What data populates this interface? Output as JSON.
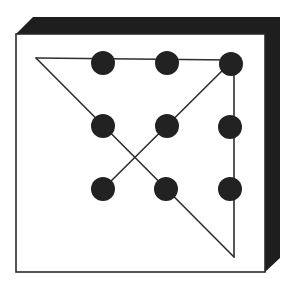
{
  "figure": {
    "width": 294,
    "height": 285,
    "colors": {
      "background": "#ffffff",
      "box_face": "#ffffff",
      "box_shadow": "#1e1e1e",
      "box_outline": "#2a2a2a",
      "dot": "#222222",
      "line": "#2e2e2e"
    },
    "box": {
      "front_face": {
        "x": 16,
        "y": 34,
        "width": 249,
        "height": 238
      },
      "shadow_polygon": "16,34 33,17 280,17 280,258 265,272 265,34"
    },
    "dots": [
      {
        "row": 1,
        "col": 1,
        "cx": 103,
        "cy": 63
      },
      {
        "row": 1,
        "col": 2,
        "cx": 167,
        "cy": 63
      },
      {
        "row": 1,
        "col": 3,
        "cx": 231,
        "cy": 64
      },
      {
        "row": 2,
        "col": 1,
        "cx": 103,
        "cy": 126
      },
      {
        "row": 2,
        "col": 2,
        "cx": 167,
        "cy": 126
      },
      {
        "row": 2,
        "col": 3,
        "cx": 230,
        "cy": 127
      },
      {
        "row": 3,
        "col": 1,
        "cx": 103,
        "cy": 189
      },
      {
        "row": 3,
        "col": 2,
        "cx": 166,
        "cy": 189
      },
      {
        "row": 3,
        "col": 3,
        "cx": 230,
        "cy": 189
      }
    ],
    "dot_radius": 12,
    "solution_path": {
      "description": "Four connected straight lines through all nine dots, extending beyond the dot grid",
      "points": [
        {
          "x": 103,
          "y": 189
        },
        {
          "x": 231,
          "y": 62
        },
        {
          "x": 234,
          "y": 257
        },
        {
          "x": 36,
          "y": 58
        },
        {
          "x": 231,
          "y": 60
        }
      ],
      "segments": [
        {
          "from": [
            103,
            189
          ],
          "to": [
            231,
            62
          ]
        },
        {
          "from": [
            234,
            66
          ],
          "to": [
            234,
            257
          ]
        },
        {
          "from": [
            234,
            257
          ],
          "to": [
            36,
            58
          ]
        },
        {
          "from": [
            36,
            58
          ],
          "to": [
            231,
            60
          ]
        }
      ]
    }
  }
}
